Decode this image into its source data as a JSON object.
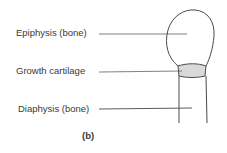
{
  "figure": {
    "panel_label": "(b)",
    "labels": [
      {
        "id": "epiphysis",
        "text": "Epiphysis (bone)"
      },
      {
        "id": "growth-cartilage",
        "text": "Growth cartilage"
      },
      {
        "id": "diaphysis",
        "text": "Diaphysis (bone)"
      }
    ],
    "colors": {
      "line": "#4a4a4a",
      "cartilage_fill": "#d9d9d9",
      "background": "#ffffff"
    }
  }
}
